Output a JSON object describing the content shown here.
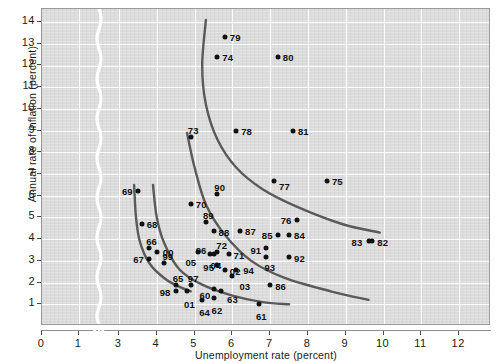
{
  "chart_data": {
    "type": "scatter",
    "title": "",
    "xlabel": "Unemployment rate (percent)",
    "ylabel": "Annual rate of inflation (percent)",
    "xlim": [
      0,
      12.6
    ],
    "ylim": [
      0,
      14.6
    ],
    "xticks": [
      0,
      1,
      3,
      4,
      5,
      6,
      7,
      8,
      9,
      10,
      11,
      12
    ],
    "yticks": [
      1,
      2,
      3,
      4,
      5,
      6,
      7,
      8,
      9,
      10,
      11,
      12,
      13,
      14
    ],
    "x_axis_break": true,
    "x_axis_break_between": [
      1,
      3
    ],
    "grid": true,
    "legend": "none",
    "background_color": "#dcdcdc",
    "gridline_color": "#ffffff",
    "point_color": "#111111",
    "curve_color": "#5a5a5a",
    "points": [
      {
        "label": "69",
        "x": 3.5,
        "y": 6.2
      },
      {
        "label": "68",
        "x": 3.6,
        "y": 4.7
      },
      {
        "label": "66",
        "x": 3.8,
        "y": 3.6
      },
      {
        "label": "00",
        "x": 4.0,
        "y": 3.4
      },
      {
        "label": "67",
        "x": 3.8,
        "y": 3.1
      },
      {
        "label": "99",
        "x": 4.2,
        "y": 2.9
      },
      {
        "label": "65",
        "x": 4.5,
        "y": 1.9
      },
      {
        "label": "98",
        "x": 4.5,
        "y": 1.6
      },
      {
        "label": "01",
        "x": 4.8,
        "y": 1.6
      },
      {
        "label": "97",
        "x": 4.9,
        "y": 1.9
      },
      {
        "label": "64",
        "x": 5.2,
        "y": 1.2
      },
      {
        "label": "70",
        "x": 4.9,
        "y": 5.6
      },
      {
        "label": "90",
        "x": 5.6,
        "y": 6.1
      },
      {
        "label": "89",
        "x": 5.3,
        "y": 4.8
      },
      {
        "label": "88",
        "x": 5.5,
        "y": 4.4
      },
      {
        "label": "87",
        "x": 6.2,
        "y": 4.4
      },
      {
        "label": "96",
        "x": 5.4,
        "y": 3.3
      },
      {
        "label": "72",
        "x": 5.6,
        "y": 3.4
      },
      {
        "label": "71",
        "x": 5.9,
        "y": 3.3
      },
      {
        "label": "05",
        "x": 5.1,
        "y": 3.4
      },
      {
        "label": "04",
        "x": 5.5,
        "y": 3.3
      },
      {
        "label": "95",
        "x": 5.6,
        "y": 2.8
      },
      {
        "label": "02",
        "x": 5.8,
        "y": 2.6
      },
      {
        "label": "94",
        "x": 6.1,
        "y": 2.6
      },
      {
        "label": "03",
        "x": 6.0,
        "y": 2.3
      },
      {
        "label": "60",
        "x": 5.5,
        "y": 1.7
      },
      {
        "label": "63",
        "x": 5.7,
        "y": 1.6
      },
      {
        "label": "62",
        "x": 5.5,
        "y": 1.3
      },
      {
        "label": "61",
        "x": 6.7,
        "y": 1.0
      },
      {
        "label": "86",
        "x": 7.0,
        "y": 1.9
      },
      {
        "label": "73",
        "x": 4.9,
        "y": 8.7
      },
      {
        "label": "78",
        "x": 6.1,
        "y": 9.0
      },
      {
        "label": "81",
        "x": 7.6,
        "y": 9.0
      },
      {
        "label": "79",
        "x": 5.8,
        "y": 13.3
      },
      {
        "label": "74",
        "x": 5.6,
        "y": 12.4
      },
      {
        "label": "80",
        "x": 7.2,
        "y": 12.4
      },
      {
        "label": "77",
        "x": 7.1,
        "y": 6.7
      },
      {
        "label": "75",
        "x": 8.5,
        "y": 6.7
      },
      {
        "label": "76",
        "x": 7.7,
        "y": 4.9
      },
      {
        "label": "85",
        "x": 7.2,
        "y": 4.2
      },
      {
        "label": "84",
        "x": 7.5,
        "y": 4.2
      },
      {
        "label": "91",
        "x": 6.9,
        "y": 3.6
      },
      {
        "label": "93",
        "x": 6.9,
        "y": 3.2
      },
      {
        "label": "92",
        "x": 7.5,
        "y": 3.2
      },
      {
        "label": "83",
        "x": 9.6,
        "y": 3.9
      },
      {
        "label": "82",
        "x": 9.7,
        "y": 3.9
      }
    ],
    "curves": [
      {
        "name": "phillips-curve-1970s",
        "points": [
          [
            3.9,
            6.5
          ],
          [
            4.0,
            5.0
          ],
          [
            4.2,
            3.8
          ],
          [
            4.6,
            2.6
          ],
          [
            5.2,
            1.9
          ],
          [
            6.0,
            1.4
          ],
          [
            6.8,
            1.1
          ],
          [
            7.5,
            1.0
          ]
        ]
      },
      {
        "name": "phillips-curve-1960s",
        "points": [
          [
            3.4,
            6.5
          ],
          [
            3.45,
            5.0
          ],
          [
            3.55,
            3.9
          ],
          [
            3.8,
            2.9
          ],
          [
            4.2,
            2.2
          ],
          [
            4.6,
            1.8
          ],
          [
            4.9,
            1.6
          ]
        ]
      },
      {
        "name": "phillips-curve-1980s",
        "points": [
          [
            4.8,
            8.9
          ],
          [
            5.0,
            7.3
          ],
          [
            5.3,
            5.6
          ],
          [
            5.8,
            4.2
          ],
          [
            6.5,
            3.0
          ],
          [
            7.4,
            2.2
          ],
          [
            8.6,
            1.6
          ],
          [
            9.6,
            1.2
          ]
        ]
      },
      {
        "name": "phillips-curve-1974-80",
        "points": [
          [
            5.3,
            14.1
          ],
          [
            5.2,
            12.0
          ],
          [
            5.3,
            10.2
          ],
          [
            5.6,
            8.6
          ],
          [
            6.1,
            7.3
          ],
          [
            6.8,
            6.3
          ],
          [
            7.7,
            5.5
          ],
          [
            8.9,
            4.7
          ],
          [
            9.9,
            4.3
          ]
        ]
      }
    ]
  }
}
